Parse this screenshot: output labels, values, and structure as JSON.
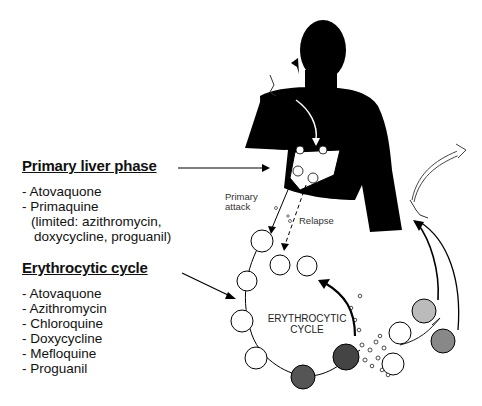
{
  "primary_liver_phase": {
    "heading": "Primary liver phase",
    "drugs": [
      "- Atovaquone",
      "- Primaquine"
    ],
    "note_line1": "(limited: azithromycin,",
    "note_line2": "doxycycline, proguanil)"
  },
  "erythrocytic_cycle": {
    "heading": "Erythrocytic cycle",
    "drugs": [
      "- Atovaquone",
      "- Azithromycin",
      "- Chloroquine",
      "- Doxycycline",
      "- Mefloquine",
      "- Proguanil"
    ]
  },
  "diagram_labels": {
    "primary_attack_line1": "Primary",
    "primary_attack_line2": "attack",
    "relapse": "Relapse",
    "cycle_line1": "ERYTHROCYTIC",
    "cycle_line2": "CYCLE"
  }
}
